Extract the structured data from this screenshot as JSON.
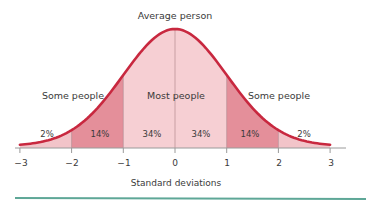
{
  "chart_data": {
    "type": "area",
    "title": "",
    "top_annotation": "Average person",
    "xlabel": "Standard deviations",
    "ylabel": "",
    "x_ticks": [
      -3,
      -2,
      -1,
      0,
      1,
      2,
      3
    ],
    "x_tick_labels": [
      "−3",
      "−2",
      "−1",
      "0",
      "1",
      "2",
      "3"
    ],
    "xlim": [
      -3,
      3
    ],
    "grid": false,
    "distribution": "normal",
    "mean": 0,
    "sd": 1,
    "segments": [
      {
        "from": -3,
        "to": -2,
        "percent": 2,
        "label": "2%"
      },
      {
        "from": -2,
        "to": -1,
        "percent": 14,
        "label": "14%"
      },
      {
        "from": -1,
        "to": 0,
        "percent": 34,
        "label": "34%"
      },
      {
        "from": 0,
        "to": 1,
        "percent": 34,
        "label": "34%"
      },
      {
        "from": 1,
        "to": 2,
        "percent": 14,
        "label": "14%"
      },
      {
        "from": 2,
        "to": 3,
        "percent": 2,
        "label": "2%"
      }
    ],
    "region_labels": [
      {
        "text": "Some people",
        "range": [
          -3,
          -1
        ]
      },
      {
        "text": "Most people",
        "range": [
          -1,
          1
        ]
      },
      {
        "text": "Some people",
        "range": [
          1,
          3
        ]
      }
    ],
    "colors": {
      "curve": "#c8283f",
      "outer_fill": "#f2c4c9",
      "mid_fill": "#e48f9a",
      "center_fill": "#f6cfd3",
      "divider": "#b58a90",
      "axis": "#9a9a9a",
      "footer_rule": "#5ea797"
    }
  },
  "labels": {
    "top": "Average person",
    "left_region": "Some people",
    "center_region": "Most people",
    "right_region": "Some people",
    "xlabel": "Standard deviations",
    "seg0": "2%",
    "seg1": "14%",
    "seg2": "34%",
    "seg3": "34%",
    "seg4": "14%",
    "seg5": "2%",
    "tick0": "−3",
    "tick1": "−2",
    "tick2": "−1",
    "tick3": "0",
    "tick4": "1",
    "tick5": "2",
    "tick6": "3"
  }
}
